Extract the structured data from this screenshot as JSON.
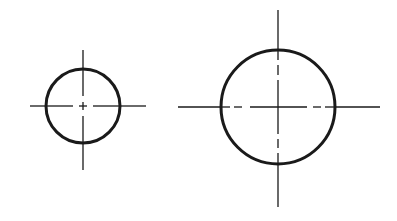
{
  "diagram": {
    "type": "technical-drawing",
    "background": "#ffffff",
    "stroke_color": "#1a1a1a",
    "circles": [
      {
        "id": "small-circle",
        "cx": 83,
        "cy": 106,
        "r": 37,
        "stroke_width": 3,
        "centerlines": {
          "horizontal": {
            "x1": 30,
            "x2": 146
          },
          "vertical": {
            "y1": 50,
            "y2": 170
          },
          "interior_dash": "8 3 4 3 28",
          "center_mark": "small-cross"
        }
      },
      {
        "id": "large-circle",
        "cx": 278,
        "cy": 107,
        "r": 57,
        "stroke_width": 3,
        "centerlines": {
          "horizontal": {
            "x1": 178,
            "x2": 380
          },
          "vertical": {
            "y1": 10,
            "y2": 207
          },
          "interior_dash": "long-dash-through-center",
          "center_mark": "cross"
        }
      }
    ]
  }
}
